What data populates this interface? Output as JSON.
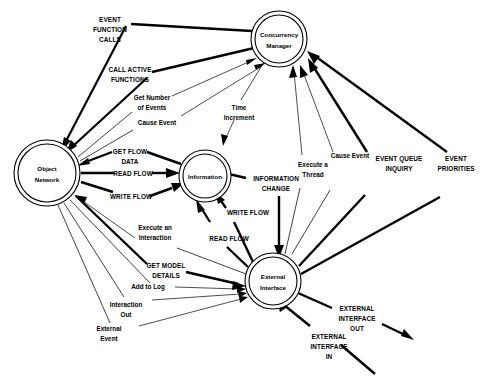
{
  "diagram": {
    "type": "data-flow-diagram",
    "title": "",
    "background_color": "#ffffff",
    "line_color": "#000000",
    "nodes": [
      {
        "id": "object_network",
        "label_line1": "Object",
        "label_line2": "Network",
        "cx": 47,
        "cy": 173,
        "r_outer": 33,
        "r_inner": 29
      },
      {
        "id": "concurrency_manager",
        "label_line1": "Concurrency",
        "label_line2": "Manager",
        "cx": 279,
        "cy": 39,
        "r_outer": 28,
        "r_inner": 24
      },
      {
        "id": "information",
        "label_line1": "Information",
        "label_line2": "",
        "cx": 205,
        "cy": 176,
        "r_outer": 26,
        "r_inner": 22
      },
      {
        "id": "external_interface",
        "label_line1": "External",
        "label_line2": "Interface",
        "cx": 273,
        "cy": 281,
        "r_outer": 28,
        "r_inner": 24
      }
    ],
    "flows": [
      {
        "id": "event_function_calls",
        "label": "EVENT\nFUNCTION\nCALLS",
        "weight": "bold",
        "from": "concurrency_manager",
        "to": "object_network"
      },
      {
        "id": "call_active_functions",
        "label": "CALL ACTIVE\nFUNCTIONS",
        "weight": "bold",
        "from": "concurrency_manager",
        "to": "object_network"
      },
      {
        "id": "get_number_of_events",
        "label": "Get Number\nof Events",
        "weight": "normal",
        "from": "object_network",
        "to": "concurrency_manager"
      },
      {
        "id": "cause_event_left",
        "label": "Cause Event",
        "weight": "normal",
        "from": "object_network",
        "to": "concurrency_manager"
      },
      {
        "id": "time_increment",
        "label": "Time\nIncrement",
        "weight": "normal",
        "from": "concurrency_manager",
        "to": "information"
      },
      {
        "id": "get_flow_data",
        "label": "GET FLOW\nDATA",
        "weight": "bold",
        "from": "information",
        "to": "object_network"
      },
      {
        "id": "read_flow_on",
        "label": "READ FLOW",
        "weight": "bold",
        "from": "object_network",
        "to": "information"
      },
      {
        "id": "write_flow_on",
        "label": "WRITE FLOW",
        "weight": "bold",
        "from": "object_network",
        "to": "information"
      },
      {
        "id": "information_change",
        "label": "INFORMATION\nCHANGE",
        "weight": "bold",
        "from": "information",
        "to": "external_interface"
      },
      {
        "id": "write_flow_ei",
        "label": "WRITE FLOW",
        "weight": "bold",
        "from": "external_interface",
        "to": "information"
      },
      {
        "id": "read_flow_ei",
        "label": "READ FLOW",
        "weight": "bold",
        "from": "external_interface",
        "to": "information"
      },
      {
        "id": "execute_a_thread",
        "label": "Execute a\nThread",
        "weight": "normal",
        "from": "external_interface",
        "to": "concurrency_manager"
      },
      {
        "id": "cause_event_right",
        "label": "Cause Event",
        "weight": "normal",
        "from": "external_interface",
        "to": "concurrency_manager"
      },
      {
        "id": "event_queue_inquiry",
        "label": "EVENT QUEUE\nINQUIRY",
        "weight": "bold",
        "from": "external_interface",
        "to": "concurrency_manager"
      },
      {
        "id": "event_priorities",
        "label": "EVENT\nPRIORITIES",
        "weight": "bold",
        "from": "external_interface",
        "to": "concurrency_manager"
      },
      {
        "id": "execute_an_interaction",
        "label": "Execute an\nInteraction",
        "weight": "normal",
        "from": "external_interface",
        "to": "object_network"
      },
      {
        "id": "get_model_details",
        "label": "GET MODEL\nDETAILS",
        "weight": "bold",
        "from": "object_network",
        "to": "external_interface"
      },
      {
        "id": "add_to_log",
        "label": "Add to Log",
        "weight": "normal",
        "from": "object_network",
        "to": "external_interface"
      },
      {
        "id": "interaction_out",
        "label": "Interaction\nOut",
        "weight": "normal",
        "from": "object_network",
        "to": "external_interface"
      },
      {
        "id": "external_event",
        "label": "External\nEvent",
        "weight": "normal",
        "from": "object_network",
        "to": "external_interface"
      },
      {
        "id": "external_interface_out",
        "label": "EXTERNAL\nINTERFACE\nOUT",
        "weight": "bold",
        "from": "external_interface",
        "to": "outside"
      },
      {
        "id": "external_interface_in",
        "label": "EXTERNAL\nINTERFACE\nIN",
        "weight": "bold",
        "from": "outside",
        "to": "external_interface"
      }
    ]
  },
  "labels": {
    "event_function_calls": {
      "l1": "EVENT",
      "l2": "FUNCTION",
      "l3": "CALLS"
    },
    "call_active_functions": {
      "l1": "CALL ACTIVE",
      "l2": "FUNCTIONS",
      "l3": ""
    },
    "get_number_of_events": {
      "l1": "Get Number",
      "l2": "of Events",
      "l3": ""
    },
    "cause_event_left": {
      "l1": "Cause Event",
      "l2": "",
      "l3": ""
    },
    "time_increment": {
      "l1": "Time",
      "l2": "Increment",
      "l3": ""
    },
    "get_flow_data": {
      "l1": "GET FLOW",
      "l2": "DATA",
      "l3": ""
    },
    "read_flow_on": {
      "l1": "READ FLOW",
      "l2": "",
      "l3": ""
    },
    "write_flow_on": {
      "l1": "WRITE FLOW",
      "l2": "",
      "l3": ""
    },
    "information_change": {
      "l1": "INFORMATION",
      "l2": "CHANGE",
      "l3": ""
    },
    "write_flow_ei": {
      "l1": "WRITE FLOW",
      "l2": "",
      "l3": ""
    },
    "read_flow_ei": {
      "l1": "READ FLOW",
      "l2": "",
      "l3": ""
    },
    "execute_a_thread": {
      "l1": "Execute a",
      "l2": "Thread",
      "l3": ""
    },
    "cause_event_right": {
      "l1": "Cause Event",
      "l2": "",
      "l3": ""
    },
    "event_queue_inquiry": {
      "l1": "EVENT QUEUE",
      "l2": "INQUIRY",
      "l3": ""
    },
    "event_priorities": {
      "l1": "EVENT",
      "l2": "PRIORITIES",
      "l3": ""
    },
    "execute_an_interaction": {
      "l1": "Execute an",
      "l2": "Interaction",
      "l3": ""
    },
    "get_model_details": {
      "l1": "GET MODEL",
      "l2": "DETAILS",
      "l3": ""
    },
    "add_to_log": {
      "l1": "Add to Log",
      "l2": "",
      "l3": ""
    },
    "interaction_out": {
      "l1": "Interaction",
      "l2": "Out",
      "l3": ""
    },
    "external_event": {
      "l1": "External",
      "l2": "Event",
      "l3": ""
    },
    "external_interface_out": {
      "l1": "EXTERNAL",
      "l2": "INTERFACE",
      "l3": "OUT"
    },
    "external_interface_in": {
      "l1": "EXTERNAL",
      "l2": "INTERFACE",
      "l3": "IN"
    }
  },
  "nodes": {
    "object_network": {
      "l1": "Object",
      "l2": "Network"
    },
    "concurrency_manager": {
      "l1": "Concurrency",
      "l2": "Manager"
    },
    "information": {
      "l1": "Information",
      "l2": ""
    },
    "external_interface": {
      "l1": "External",
      "l2": "Interface"
    }
  }
}
